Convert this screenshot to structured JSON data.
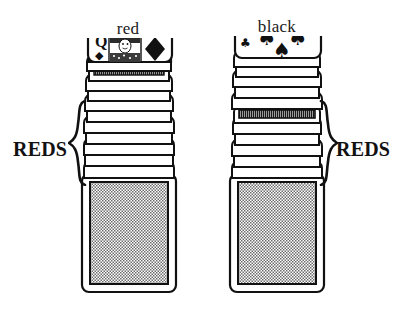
{
  "figure": {
    "type": "card-pile-diagram",
    "background_color": "#ffffff",
    "ink_color": "#111111"
  },
  "labels": {
    "left_pile_label": "red",
    "right_pile_label": "black",
    "left_brace_label": "REDS",
    "right_brace_label": "REDS"
  },
  "piles": [
    {
      "id": "red-pile",
      "heading": "red",
      "top_card": {
        "rank": "Q",
        "rank_glyph": "Q",
        "suit": "diamonds",
        "suit_glyph": "♦",
        "color": "#111111",
        "face": "court",
        "description": "Queen of Diamonds, face up, showing corner index Q with diamond pip, central portrait panel and a large diamond pip"
      },
      "stack_edge_count": 11,
      "highlighted_edge_index": 2,
      "highlighted_edge_note": "dark hatched card edge near the top of the stack",
      "bottom_card": {
        "face": "back",
        "pattern": "checkered",
        "pattern_color": "#8c8c8c"
      },
      "brace_side": "left",
      "brace_label": "REDS"
    },
    {
      "id": "black-pile",
      "heading": "black",
      "top_card": {
        "rank": "7",
        "rank_glyph": "7",
        "suit": "spades",
        "suit_glyph": "♠",
        "color": "#111111",
        "face": "pip",
        "pip_count": 3,
        "description": "Seven of Spades, face up, showing corner index 7 with club-like pip and three large spade pips"
      },
      "stack_edge_count": 11,
      "highlighted_edge_index": 5,
      "highlighted_edge_note": "dark hatched card edge in the middle of the stack",
      "bottom_card": {
        "face": "back",
        "pattern": "checkered",
        "pattern_color": "#8c8c8c"
      },
      "brace_side": "right",
      "brace_label": "REDS"
    }
  ]
}
